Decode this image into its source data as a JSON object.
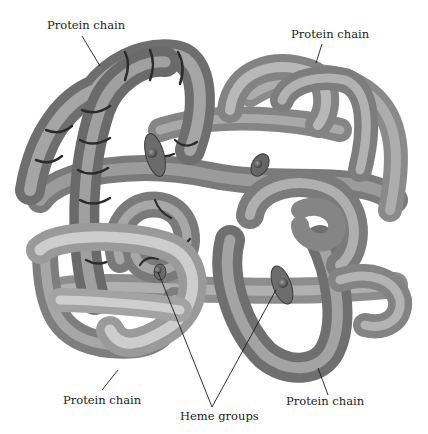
{
  "figure": {
    "labels": {
      "top_left": "Protein chain",
      "top_right": "Protein chain",
      "bottom_left": "Protein chain",
      "bottom_right": "Protein chain",
      "bottom_center": "Heme groups"
    },
    "colors": {
      "background": "#ffffff",
      "tube_light": "#c8c8c8",
      "tube_mid": "#8f8f8f",
      "tube_dark": "#4a4a4a",
      "ribbon": "#2e2e2e",
      "heme": "#6a6a6a",
      "leader_line": "#1a1a1a"
    }
  }
}
